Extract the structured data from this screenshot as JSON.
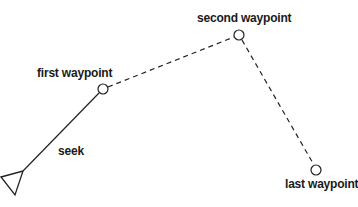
{
  "diagram": {
    "stroke_color": "#222222",
    "background": "#ffffff",
    "agent": {
      "shape": "triangle",
      "points": [
        [
          1,
          177
        ],
        [
          23,
          171
        ],
        [
          15,
          195
        ]
      ]
    },
    "seek_line": {
      "from": [
        23,
        171
      ],
      "to": [
        99,
        93
      ],
      "style": "solid",
      "label": "seek"
    },
    "waypoints": [
      {
        "id": "first",
        "label": "first waypoint",
        "center": [
          103,
          89
        ],
        "radius": 5
      },
      {
        "id": "second",
        "label": "second waypoint",
        "center": [
          239,
          35
        ],
        "radius": 5
      },
      {
        "id": "last",
        "label": "last waypoint",
        "center": [
          316,
          170
        ],
        "radius": 5
      }
    ],
    "path_segments": [
      {
        "from": [
          108,
          87
        ],
        "to": [
          234,
          37
        ],
        "style": "dashed"
      },
      {
        "from": [
          242,
          40
        ],
        "to": [
          314,
          165
        ],
        "style": "dashed"
      }
    ]
  },
  "labels": {
    "first": "first waypoint",
    "second": "second waypoint",
    "last": "last waypoint",
    "seek": "seek"
  }
}
